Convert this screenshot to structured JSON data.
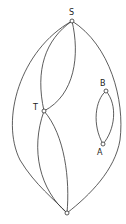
{
  "diagram": {
    "type": "graph",
    "nodes": [
      {
        "id": "S",
        "label": "S",
        "x": 72,
        "y": 21,
        "label_x": 69,
        "label_y": 15
      },
      {
        "id": "T",
        "label": "T",
        "x": 44,
        "y": 111,
        "label_x": 33,
        "label_y": 110
      },
      {
        "id": "B",
        "label": "B",
        "x": 106,
        "y": 91,
        "label_x": 100,
        "label_y": 86
      },
      {
        "id": "A",
        "label": "A",
        "x": 103,
        "y": 144,
        "label_x": 97,
        "label_y": 155
      },
      {
        "id": "BOTTOM",
        "label": "",
        "x": 67,
        "y": 213,
        "label_x": 0,
        "label_y": 0
      }
    ],
    "edges": [
      {
        "from": "S",
        "to": "BOTTOM",
        "path": "M72,21 C20,50 0,120 20,160 C35,185 55,200 67,213"
      },
      {
        "from": "S",
        "to": "BOTTOM",
        "path": "M72,21 C110,45 125,100 120,140 C115,170 90,195 67,213"
      },
      {
        "from": "S",
        "to": "T",
        "path": "M72,21 C45,40 35,70 44,111"
      },
      {
        "from": "S",
        "to": "T",
        "path": "M72,21 C80,55 75,95 44,111"
      },
      {
        "from": "T",
        "to": "BOTTOM",
        "path": "M44,111 C30,150 40,190 67,213"
      },
      {
        "from": "T",
        "to": "BOTTOM",
        "path": "M44,111 C65,135 70,180 67,213"
      },
      {
        "from": "B",
        "to": "A",
        "path": "M106,91 C95,100 92,125 103,144"
      },
      {
        "from": "B",
        "to": "A",
        "path": "M106,91 C118,105 115,130 103,144"
      }
    ]
  }
}
